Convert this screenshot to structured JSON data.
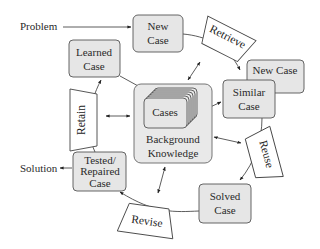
{
  "diagram": {
    "inputs": {
      "problem": "Problem",
      "solution": "Solution"
    },
    "boxes": {
      "new_case_top": [
        "New",
        "Case"
      ],
      "new_case_right": [
        "New Case"
      ],
      "similar_case": [
        "Similar",
        "Case"
      ],
      "learned_case": [
        "Learned",
        "Case"
      ],
      "tested_repaired_case": [
        "Tested/",
        "Repaired",
        "Case"
      ],
      "solved_case": [
        "Solved",
        "Case"
      ],
      "cases": [
        "Cases"
      ],
      "background_knowledge": [
        "Background",
        "Knowledge"
      ]
    },
    "steps": {
      "retrieve": "Retrieve",
      "reuse": "Reuse",
      "revise": "Revise",
      "retain": "Retain"
    },
    "colors": {
      "box_fill": "#e6e6e6",
      "box_stroke": "#555555",
      "step_fill": "#ffffff",
      "line": "#333333"
    }
  }
}
